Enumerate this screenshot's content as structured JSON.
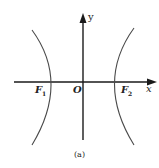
{
  "figure": {
    "caption": "(a)",
    "type": "hyperbola",
    "orientation": "horizontal transverse axis",
    "colors": {
      "axis": "#1a1a1a",
      "curve": "#4a4a4a",
      "text": "#222222",
      "background": "#ffffff"
    }
  },
  "axes": {
    "x_label": "x",
    "y_label": "y",
    "origin_label": "O"
  },
  "points": {
    "focus_left": {
      "label": "F",
      "subscript": "1"
    },
    "focus_right": {
      "label": "F",
      "subscript": "2"
    }
  }
}
